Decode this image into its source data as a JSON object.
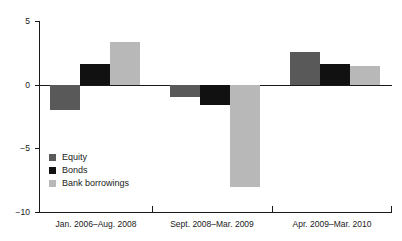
{
  "chart_data": {
    "type": "bar",
    "title": "",
    "subtitle": "",
    "xlabel": "",
    "ylabel": "",
    "categories": [
      "Jan. 2006–Aug. 2008",
      "Sept. 2008–Mar. 2009",
      "Apr. 2009–Mar. 2010"
    ],
    "series": [
      {
        "name": "Equity",
        "color": "#595959",
        "values": [
          -2.0,
          -0.95,
          2.6
        ]
      },
      {
        "name": "Bonds",
        "color": "#111111",
        "values": [
          1.65,
          -1.6,
          1.65
        ]
      },
      {
        "name": "Bank borrowings",
        "color": "#b8b8b8",
        "values": [
          3.35,
          -8.05,
          1.5
        ]
      }
    ],
    "ylim": [
      -10,
      5
    ],
    "yticks": [
      5,
      0,
      -5,
      -10
    ],
    "ytick_labels": [
      "5",
      "0",
      "−5",
      "−10"
    ],
    "grid": false,
    "zero_line": true,
    "legend_position": "inside-bottom-left",
    "annotations": []
  },
  "axis": {
    "y_label_5": "5",
    "y_label_0": "0",
    "y_label_neg5": "−5",
    "y_label_neg10": "−10"
  },
  "legend": {
    "items": [
      {
        "label": "Equity"
      },
      {
        "label": "Bonds"
      },
      {
        "label": "Bank borrowings"
      }
    ]
  }
}
